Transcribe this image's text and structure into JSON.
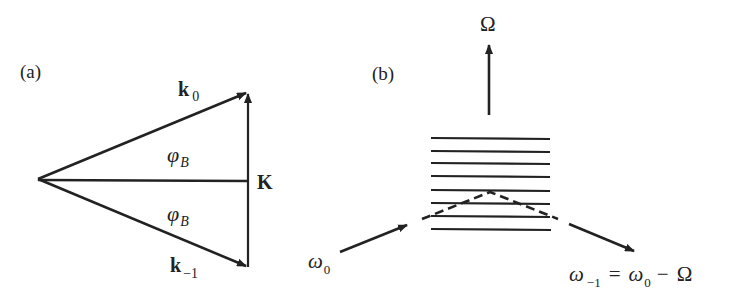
{
  "panel_a": {
    "label": "(a)",
    "vectors": {
      "k0": {
        "symbol": "k",
        "subscript": "0"
      },
      "k_minus1": {
        "symbol": "k",
        "subscript": "−1"
      },
      "K": {
        "symbol": "K"
      }
    },
    "angles": [
      {
        "symbol": "φ",
        "subscript": "B"
      },
      {
        "symbol": "φ",
        "subscript": "B"
      }
    ]
  },
  "panel_b": {
    "label": "(b)",
    "omega_big": "Ω",
    "incident": {
      "symbol": "ω",
      "subscript": "0"
    },
    "scattered": {
      "symbol": "ω",
      "subscript": "−1",
      "equation_rhs_symbol": "ω",
      "equation_rhs_subscript": "0",
      "equals": "=",
      "minus": "−",
      "omega_big": "Ω"
    },
    "grating_line_count": 8
  },
  "colors": {
    "ink": "#222222",
    "background": "#ffffff"
  }
}
